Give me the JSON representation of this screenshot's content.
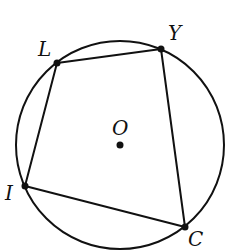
{
  "diagram": {
    "type": "inscribed-quadrilateral",
    "circle": {
      "center_label": "O",
      "cx": 120,
      "cy": 145,
      "r": 104
    },
    "vertices": [
      {
        "label": "L",
        "x": 57,
        "y": 63,
        "lx": 38,
        "ly": 56
      },
      {
        "label": "Y",
        "x": 161,
        "y": 49,
        "lx": 168,
        "ly": 40
      },
      {
        "label": "C",
        "x": 185,
        "y": 227,
        "lx": 188,
        "ly": 246
      },
      {
        "label": "I",
        "x": 25,
        "y": 186,
        "lx": 5,
        "ly": 200
      }
    ],
    "center": {
      "label": "O",
      "x": 120,
      "y": 145,
      "lx": 112,
      "ly": 135
    },
    "stroke_color": "#111111"
  }
}
